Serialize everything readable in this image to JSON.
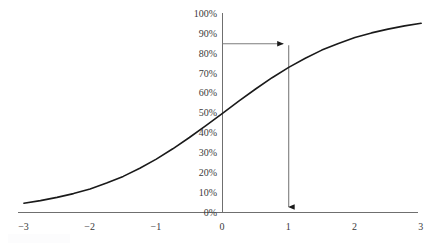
{
  "chart_data": {
    "type": "line",
    "title": "",
    "subtitle": "",
    "xlabel": "",
    "ylabel": "",
    "xlim": [
      -3,
      3
    ],
    "ylim": [
      0,
      1
    ],
    "grid": false,
    "legend": null,
    "curve_name": "logistic-sigmoid",
    "formula": "1 / (1 + e^(-x))",
    "x_tick_labels": [
      "−3",
      "−2",
      "−1",
      "0",
      "1",
      "2",
      "3"
    ],
    "x_tick_values": [
      -3,
      -2,
      -1,
      0,
      1,
      2,
      3
    ],
    "y_tick_labels": [
      "0%",
      "10%",
      "20%",
      "30%",
      "40%",
      "50%",
      "60%",
      "70%",
      "80%",
      "90%",
      "100%"
    ],
    "y_tick_values": [
      0,
      0.1,
      0.2,
      0.3,
      0.4,
      0.5,
      0.6,
      0.7,
      0.8,
      0.9,
      1.0
    ],
    "x": [
      -3.0,
      -2.75,
      -2.5,
      -2.25,
      -2.0,
      -1.75,
      -1.5,
      -1.25,
      -1.0,
      -0.75,
      -0.5,
      -0.25,
      0.0,
      0.25,
      0.5,
      0.75,
      1.0,
      1.25,
      1.5,
      1.75,
      2.0,
      2.25,
      2.5,
      2.75,
      3.0
    ],
    "values": [
      0.047,
      0.06,
      0.076,
      0.095,
      0.119,
      0.148,
      0.182,
      0.223,
      0.269,
      0.321,
      0.378,
      0.438,
      0.5,
      0.562,
      0.622,
      0.679,
      0.731,
      0.777,
      0.818,
      0.852,
      0.881,
      0.905,
      0.924,
      0.94,
      0.953
    ],
    "annotations": [
      {
        "name": "horizontal-readout-arrow",
        "from_x": 0,
        "to_x": 1,
        "y": 0.85,
        "direction": "right",
        "arrowhead": true,
        "color": "#7d7d7d"
      },
      {
        "name": "vertical-readout-arrow",
        "x": 1,
        "from_y": 0.85,
        "to_y": 0,
        "direction": "down",
        "arrowhead": true,
        "color": "#7d7d7d"
      }
    ],
    "colors": {
      "curve": "#1a1a1a",
      "axis": "#6f6f6f",
      "annotation": "#7d7d7d",
      "tick_text": "#3a3a3a",
      "background": "#ffffff"
    }
  }
}
